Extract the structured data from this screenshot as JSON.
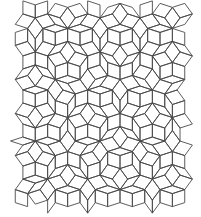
{
  "figure": {
    "type": "penrose-rhombus-tiling",
    "background": "#ffffff",
    "stroke_color": "#4a4a4a",
    "stroke_width": 0.9,
    "edge_length": 13,
    "center": [
      100,
      107
    ],
    "bounds": {
      "x0": 20,
      "y0": 8,
      "x1": 183,
      "y1": 205
    },
    "rotation_deg": 90,
    "offsets": [
      0.21,
      0.37,
      0.11,
      0.29,
      0.02
    ],
    "grid_range": 14
  }
}
